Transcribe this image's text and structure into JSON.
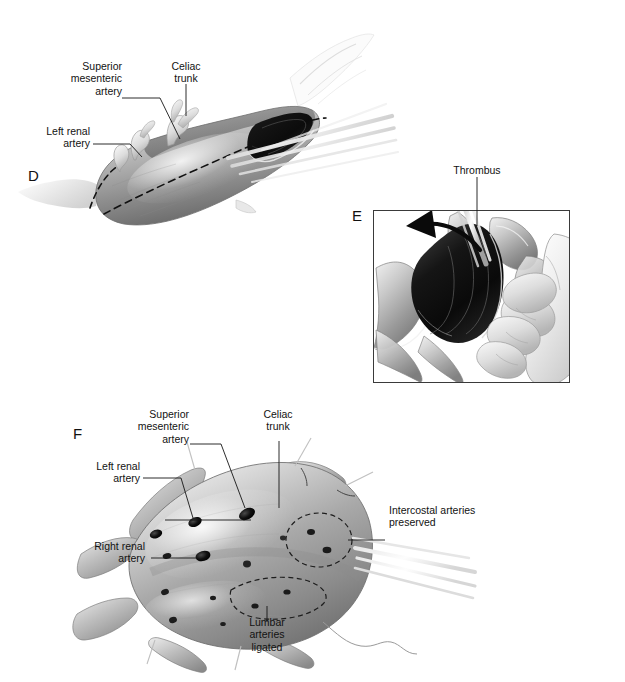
{
  "figure": {
    "background_color": "#ffffff",
    "ink_color": "#151515",
    "style": "grayscale medical line-and-wash illustration"
  },
  "panels": [
    {
      "id": "D",
      "letter": "D",
      "caption": "Aorta opened longitudinally; visceral vessel origins exposed",
      "labels": [
        {
          "name": "superior-mesenteric-artery",
          "text": "Superior\nmesenteric\nartery",
          "align": "right"
        },
        {
          "name": "celiac-trunk",
          "text": "Celiac\ntrunk",
          "align": "center"
        },
        {
          "name": "left-renal-artery",
          "text": "Left renal\nartery",
          "align": "right"
        }
      ]
    },
    {
      "id": "E",
      "letter": "E",
      "caption": "Surgeon's hand retracting aortic wall; laminated thrombus being elevated",
      "framed": true,
      "labels": [
        {
          "name": "thrombus",
          "text": "Thrombus",
          "align": "center"
        }
      ]
    },
    {
      "id": "F",
      "letter": "F",
      "caption": "Interior of opened aneurysm sac showing arterial ostia",
      "labels": [
        {
          "name": "superior-mesenteric-artery",
          "text": "Superior\nmesenteric\nartery",
          "align": "right"
        },
        {
          "name": "celiac-trunk",
          "text": "Celiac\ntrunk",
          "align": "center"
        },
        {
          "name": "left-renal-artery",
          "text": "Left renal\nartery",
          "align": "right"
        },
        {
          "name": "right-renal-artery",
          "text": "Right renal\nartery",
          "align": "right"
        },
        {
          "name": "intercostal-arteries-preserved",
          "text": "Intercostal arteries\npreserved",
          "align": "left"
        },
        {
          "name": "lumbar-arteries-ligated",
          "text": "Lumbar\narteries\nligated",
          "align": "center"
        }
      ]
    }
  ],
  "labels_flat": {
    "d_sma": "Superior\nmesenteric\nartery",
    "d_celiac": "Celiac\ntrunk",
    "d_left_renal": "Left renal\nartery",
    "d_letter": "D",
    "e_thrombus": "Thrombus",
    "e_letter": "E",
    "f_sma": "Superior\nmesenteric\nartery",
    "f_celiac": "Celiac\ntrunk",
    "f_left_renal": "Left renal\nartery",
    "f_right_renal": "Right renal\nartery",
    "f_intercostal": "Intercostal arteries\npreserved",
    "f_lumbar": "Lumbar\narteries\nligated",
    "f_letter": "F"
  }
}
